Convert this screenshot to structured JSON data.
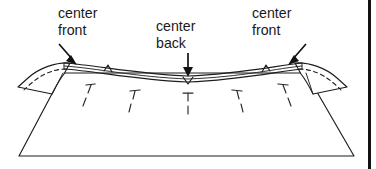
{
  "figure": {
    "background_color": "#ffffff",
    "ink_color": "#1d1d1d",
    "text_color": "#1a1a1a"
  },
  "labels": [
    {
      "id": "center-front-left",
      "line1": "center",
      "line2": "front",
      "x": 58,
      "y": 18,
      "arrow": {
        "x1": 59,
        "y1": 44,
        "x2": 76,
        "y2": 63,
        "direction": "down-right"
      }
    },
    {
      "id": "center-back",
      "line1": "center",
      "line2": "back",
      "x": 156,
      "y": 31,
      "arrow": {
        "x1": 188,
        "y1": 51,
        "x2": 188,
        "y2": 76,
        "direction": "down"
      }
    },
    {
      "id": "center-front-right",
      "line1": "center",
      "line2": "front",
      "x": 252,
      "y": 18,
      "arrow": {
        "x1": 305,
        "y1": 44,
        "x2": 289,
        "y2": 63,
        "direction": "down-left"
      }
    }
  ],
  "pins": [
    {
      "id": "pin-1",
      "x": 91,
      "y": 92,
      "slant": "left"
    },
    {
      "id": "pin-2",
      "x": 135,
      "y": 97,
      "slant": "left"
    },
    {
      "id": "pin-3",
      "x": 188,
      "y": 99,
      "slant": "straight"
    },
    {
      "id": "pin-4",
      "x": 237,
      "y": 97,
      "slant": "right"
    },
    {
      "id": "pin-5",
      "x": 283,
      "y": 92,
      "slant": "right"
    }
  ],
  "notches": [
    {
      "id": "notch-center-back",
      "x": 188,
      "y": 82,
      "label_ref": "center-back"
    },
    {
      "id": "notch-left-seam",
      "x": 108,
      "y": 70,
      "label_ref": null
    },
    {
      "id": "notch-right-seam",
      "x": 266,
      "y": 70,
      "label_ref": null
    }
  ],
  "parts": {
    "skirt_body": "trapezoid body of skirt below the waistband",
    "waistband": "narrow curved band of three parallel lines",
    "left_sleeve_cap": "curved flap at left with dashed seam guide",
    "right_sleeve_cap": "curved flap at right with dashed seam guide"
  },
  "page_rule": {
    "id": "page-border-rule",
    "x": 368,
    "width": 3,
    "color": "#111111"
  }
}
